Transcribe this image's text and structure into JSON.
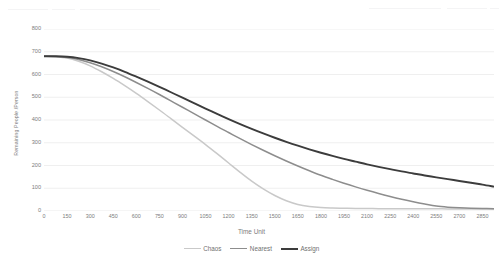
{
  "chart_data": {
    "type": "line",
    "title": "",
    "xlabel": "Time Unit",
    "ylabel": "Remaining People /Person",
    "xlim": [
      0,
      2925
    ],
    "ylim": [
      0,
      800
    ],
    "grid": true,
    "grid_axis": "y",
    "legend_position": "bottom",
    "x_ticks": [
      0,
      150,
      300,
      450,
      600,
      750,
      900,
      1050,
      1200,
      1350,
      1500,
      1650,
      1800,
      1950,
      2100,
      2250,
      2400,
      2550,
      2700,
      2850
    ],
    "y_ticks": [
      0,
      100,
      200,
      300,
      400,
      500,
      600,
      700,
      800
    ],
    "x": [
      0,
      75,
      150,
      225,
      300,
      375,
      450,
      525,
      600,
      675,
      750,
      825,
      900,
      975,
      1050,
      1125,
      1200,
      1275,
      1350,
      1425,
      1500,
      1575,
      1650,
      1725,
      1800,
      1875,
      1950,
      2025,
      2100,
      2175,
      2250,
      2325,
      2400,
      2475,
      2550,
      2625,
      2700,
      2775,
      2850,
      2925
    ],
    "series": [
      {
        "name": "Chaos",
        "color": "#c9c9c9",
        "width": 1.5,
        "values": [
          680,
          678,
          672,
          658,
          638,
          612,
          583,
          551,
          517,
          481,
          444,
          406,
          368,
          330,
          292,
          252,
          211,
          170,
          131,
          97,
          68,
          45,
          29,
          20,
          15,
          13,
          12,
          11,
          11,
          10,
          10,
          10,
          10,
          10,
          10,
          9,
          9,
          9,
          9,
          9
        ]
      },
      {
        "name": "Nearest",
        "color": "#8d8d8d",
        "width": 1.5,
        "values": [
          680,
          679,
          675,
          666,
          652,
          634,
          613,
          590,
          565,
          539,
          512,
          484,
          456,
          428,
          400,
          372,
          345,
          318,
          292,
          267,
          243,
          220,
          198,
          177,
          157,
          139,
          122,
          106,
          91,
          77,
          64,
          52,
          41,
          31,
          22,
          17,
          14,
          12,
          11,
          10
        ]
      },
      {
        "name": "Assign",
        "color": "#3c3c3c",
        "width": 1.9,
        "values": [
          680,
          680,
          678,
          672,
          662,
          648,
          631,
          612,
          591,
          569,
          546,
          522,
          498,
          474,
          450,
          427,
          404,
          382,
          361,
          341,
          322,
          304,
          287,
          271,
          256,
          242,
          229,
          217,
          205,
          194,
          184,
          174,
          165,
          156,
          148,
          140,
          132,
          124,
          116,
          107
        ]
      }
    ]
  },
  "legend": {
    "items": [
      {
        "label": "Chaos"
      },
      {
        "label": "Nearest"
      },
      {
        "label": "Assign"
      }
    ]
  },
  "axes": {
    "x_title": "Time Unit",
    "y_title": "Remaining People /Person"
  },
  "colors": {
    "chaos": "#c9c9c9",
    "nearest": "#8d8d8d",
    "assign": "#3c3c3c",
    "grid": "#e8e8e8",
    "text": "#7d7d7d",
    "background": "#ffffff"
  }
}
